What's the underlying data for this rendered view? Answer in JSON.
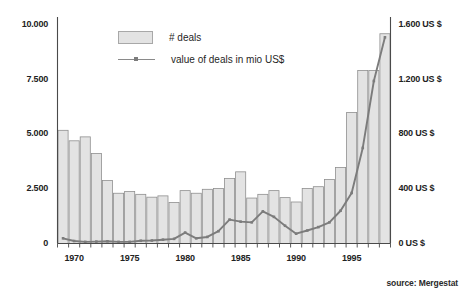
{
  "chart_data": {
    "type": "bar",
    "title": "",
    "subtitle": "",
    "xlabel": "",
    "ylabel": "",
    "ylabel_right": "",
    "grid": false,
    "legend_position": "top-left-inside",
    "source": "source: Mergestat",
    "x": [
      1969,
      1970,
      1971,
      1972,
      1973,
      1974,
      1975,
      1976,
      1977,
      1978,
      1979,
      1980,
      1981,
      1982,
      1983,
      1984,
      1985,
      1986,
      1987,
      1988,
      1989,
      1990,
      1991,
      1992,
      1993,
      1994,
      1995,
      1996,
      1997,
      1998
    ],
    "x_tick_labels": [
      "1970",
      "1975",
      "1980",
      "1985",
      "1990",
      "1995"
    ],
    "x_tick_values": [
      1970,
      1975,
      1980,
      1985,
      1990,
      1995
    ],
    "xlim": [
      1968.5,
      1998.5
    ],
    "ylim": [
      0,
      10000
    ],
    "ylim_right": [
      0,
      1600
    ],
    "y_tick_labels": [
      "10.000",
      "7.500",
      "5.000",
      "2.500",
      "0"
    ],
    "y_tick_values": [
      10000,
      7500,
      5000,
      2500,
      0
    ],
    "y_right_tick_labels": [
      "1.600 US $",
      "1.200 US $",
      "800 US $",
      "400 US $",
      "0 US $"
    ],
    "y_right_tick_values": [
      1600,
      1200,
      800,
      400,
      0
    ],
    "series": [
      {
        "name": "# deals",
        "type": "bar",
        "axis": "left",
        "color": "#e3e3e3",
        "edge_color": "#8f8f8f",
        "values": [
          5180,
          4700,
          4880,
          4120,
          2880,
          2300,
          2380,
          2250,
          2120,
          2180,
          1880,
          2420,
          2300,
          2480,
          2520,
          2980,
          3280,
          2080,
          2250,
          2420,
          2100,
          1900,
          2520,
          2600,
          2930,
          3480,
          6000,
          7920,
          7920,
          9600
        ]
      },
      {
        "name": "value of deals in mio US$",
        "type": "line",
        "axis": "right",
        "color": "#7c7c7c",
        "values": [
          38,
          18,
          12,
          14,
          16,
          12,
          12,
          20,
          22,
          28,
          34,
          80,
          38,
          48,
          90,
          175,
          160,
          155,
          235,
          195,
          130,
          72,
          95,
          120,
          155,
          240,
          370,
          700,
          1190,
          1510
        ]
      }
    ]
  },
  "legend": {
    "items": [
      {
        "label": "# deals",
        "marker": "swatch"
      },
      {
        "label": "value of deals in mio US$",
        "marker": "line"
      }
    ]
  },
  "colors": {
    "bar_fill": "#e3e3e3",
    "bar_edge": "#8f8f8f",
    "line": "#7c7c7c",
    "axis": "#4a4a4a",
    "text": "#1f1f1f",
    "background": "#ffffff"
  },
  "source": {
    "text": "source: Mergestat"
  }
}
